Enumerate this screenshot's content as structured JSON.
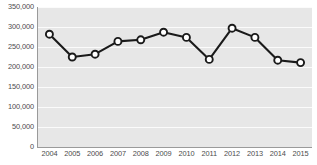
{
  "chart_data": {
    "type": "line",
    "title": "",
    "subtitle": "",
    "xlabel": "",
    "ylabel": "",
    "categories": [
      "2004",
      "2005",
      "2006",
      "2007",
      "2008",
      "2009",
      "2010",
      "2011",
      "2012",
      "2013",
      "2014",
      "2015"
    ],
    "values": [
      282000,
      225000,
      232000,
      264000,
      268000,
      287000,
      274000,
      219000,
      297000,
      274000,
      217000,
      211000
    ],
    "series": [
      {
        "name": "",
        "values": [
          282000,
          225000,
          232000,
          264000,
          268000,
          287000,
          274000,
          219000,
          297000,
          274000,
          217000,
          211000
        ]
      }
    ],
    "ylim": [
      0,
      350000
    ],
    "ytick_values": [
      350000,
      300000,
      250000,
      200000,
      150000,
      100000,
      50000,
      0
    ],
    "ytick_labels": [
      "350,000",
      "300,000",
      "250,000",
      "200,000",
      "150,000",
      "100,000",
      "50,000",
      "0"
    ],
    "grid": true,
    "legend": false,
    "legend_position": "none",
    "annotations": [],
    "colors": {
      "line": "#1a1a1a",
      "marker_fill": "#ffffff",
      "marker_stroke": "#1a1a1a",
      "plot_background": "#e7e7e7",
      "gridline": "#fbfbfb",
      "axis": "#9a9a9a",
      "tick_label": "#4c4c4c"
    }
  }
}
